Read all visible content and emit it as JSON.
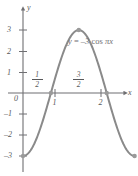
{
  "figure": {
    "width": 138,
    "height": 176,
    "background": "#ffffff"
  },
  "axis": {
    "x_name": "x",
    "y_name": "y",
    "color": "#6f6f72",
    "origin_label": "0"
  },
  "equation_label": {
    "lhs": "y",
    "eq": "=",
    "coefficient": "–3",
    "func": "cos",
    "arg": "πx",
    "full": "y = –3 cos πx"
  },
  "y_ticks": [
    {
      "label": "3",
      "value": 3
    },
    {
      "label": "2",
      "value": 2
    },
    {
      "label": "1",
      "value": 1
    },
    {
      "label": "–1",
      "value": -1
    },
    {
      "label": "–2",
      "value": -2
    },
    {
      "label": "–3",
      "value": -3
    }
  ],
  "x_ticks": [
    {
      "label": "1",
      "value": 1,
      "position": "below"
    },
    {
      "label": "2",
      "value": 2,
      "position": "below"
    }
  ],
  "x_fraction_labels": [
    {
      "numerator": "1",
      "denominator": "2",
      "value": 0.5,
      "position": "above"
    },
    {
      "numerator": "3",
      "denominator": "2",
      "value": 1.5,
      "position": "above"
    }
  ],
  "chart_data": {
    "type": "line",
    "title": "",
    "subtitle": "",
    "xlabel": "x",
    "ylabel": "y",
    "xlim": [
      -0.12,
      2.4
    ],
    "ylim": [
      -3.45,
      3.5
    ],
    "grid": false,
    "legend": null,
    "curve_color": "#8a8a8a",
    "curve_width": 2,
    "annotations": [
      {
        "text": "y = –3 cos πx",
        "x": 1.55,
        "y": 2.35
      }
    ],
    "series": [
      {
        "name": "y = -3 cos(pi x)",
        "equation": "y = -3*cos(pi*x)",
        "domain": [
          0,
          2
        ],
        "samples": 161,
        "x": [
          0,
          0.25,
          0.5,
          0.75,
          1,
          1.25,
          1.5,
          1.75,
          2
        ],
        "values": [
          -3,
          -2.121,
          0,
          2.121,
          3,
          2.121,
          0,
          -2.121,
          -3
        ]
      }
    ],
    "markers": [
      {
        "x": 0,
        "y": -3,
        "label": ""
      },
      {
        "x": 0.5,
        "y": 0,
        "label": ""
      },
      {
        "x": 1,
        "y": 3,
        "label": ""
      },
      {
        "x": 1.5,
        "y": 0,
        "label": ""
      },
      {
        "x": 2,
        "y": -3,
        "label": ""
      }
    ]
  }
}
